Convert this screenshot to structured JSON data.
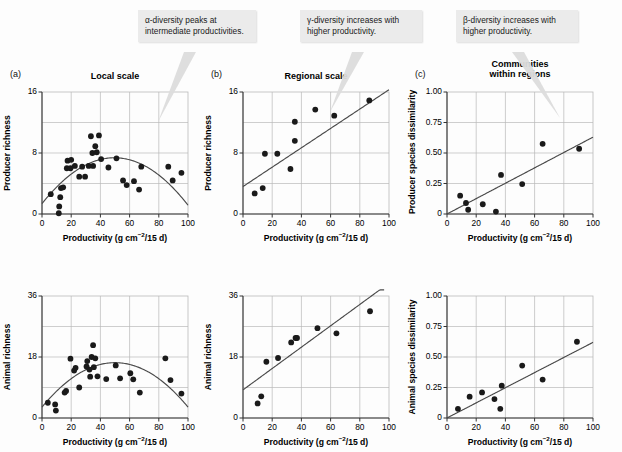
{
  "figure": {
    "width": 622,
    "height": 452,
    "background": "#fdfdfd",
    "point_color": "#1a1a1a",
    "line_color": "#4a4a4a",
    "grid_color": "#b9b9b9",
    "axis_color": "#333333",
    "callout_bg": "#ebebeb"
  },
  "callouts": [
    {
      "id": "callout-alpha",
      "text": "α-diversity peaks at\nintermediate productivities.",
      "x": 138,
      "y": 10,
      "width": 118
    },
    {
      "id": "callout-gamma",
      "text": "γ-diversity increases with\nhigher productivity.",
      "x": 300,
      "y": 10,
      "width": 122
    },
    {
      "id": "callout-beta",
      "text": "β-diversity increases with\nhigher productivity.",
      "x": 456,
      "y": 10,
      "width": 122
    }
  ],
  "axes": {
    "xlabel_prefix": "Productivity (g cm",
    "xlabel_sup": "−2",
    "xlabel_suffix": "/15 d)",
    "x_ticks": [
      0,
      20,
      40,
      60,
      80,
      100
    ],
    "x_range": [
      0,
      100
    ]
  },
  "panels": [
    {
      "letter": "(a)",
      "title": "Local scale",
      "show_title": true
    },
    {
      "letter": "(b)",
      "title": "Regional scale",
      "show_title": true
    },
    {
      "letter": "(c)",
      "title": "Communities\nwithin regions",
      "show_title": true
    }
  ],
  "chart_data": [
    {
      "id": "a-top",
      "type": "scatter",
      "title": "Local scale",
      "panel_letter": "(a)",
      "xlabel": "Productivity (g cm−2/15 d)",
      "ylabel": "Producer richness",
      "xlim": [
        0,
        100
      ],
      "ylim": [
        0,
        16
      ],
      "x_ticks": [
        0,
        20,
        40,
        60,
        80,
        100
      ],
      "y_ticks": [
        0,
        8,
        16
      ],
      "y_minor_gridlines": [
        4,
        12
      ],
      "grid": true,
      "fit": {
        "kind": "quadratic",
        "a": -0.00245,
        "b": 0.243,
        "c": 1.35
      },
      "points": [
        [
          6.0,
          2.6
        ],
        [
          11.5,
          0.1
        ],
        [
          11.8,
          1.0
        ],
        [
          12.5,
          2.2
        ],
        [
          13.0,
          3.4
        ],
        [
          14.5,
          3.5
        ],
        [
          17.0,
          6.0
        ],
        [
          17.5,
          7.0
        ],
        [
          19.5,
          6.0
        ],
        [
          20.0,
          7.1
        ],
        [
          22.5,
          6.3
        ],
        [
          25.5,
          4.9
        ],
        [
          27.5,
          6.2
        ],
        [
          29.5,
          4.9
        ],
        [
          32.0,
          6.3
        ],
        [
          33.5,
          10.2
        ],
        [
          34.5,
          8.0
        ],
        [
          35.0,
          6.3
        ],
        [
          36.5,
          8.9
        ],
        [
          37.5,
          8.1
        ],
        [
          39.0,
          10.3
        ],
        [
          40.5,
          7.2
        ],
        [
          45.5,
          6.1
        ],
        [
          51.0,
          7.3
        ],
        [
          55.5,
          4.4
        ],
        [
          58.0,
          3.8
        ],
        [
          63.0,
          4.3
        ],
        [
          66.5,
          3.2
        ],
        [
          68.0,
          6.2
        ],
        [
          86.5,
          6.2
        ],
        [
          89.5,
          4.4
        ],
        [
          95.5,
          5.4
        ]
      ]
    },
    {
      "id": "b-top",
      "type": "scatter",
      "title": "Regional scale",
      "panel_letter": "(b)",
      "xlabel": "Productivity (g cm−2/15 d)",
      "ylabel": "Producer richness",
      "xlim": [
        0,
        100
      ],
      "ylim": [
        0,
        16
      ],
      "x_ticks": [
        0,
        20,
        40,
        60,
        80,
        100
      ],
      "y_ticks": [
        0,
        8,
        16
      ],
      "y_minor_gridlines": [
        4,
        12
      ],
      "grid": true,
      "fit": {
        "kind": "linear",
        "slope": 0.127,
        "intercept": 3.6
      },
      "points": [
        [
          8.0,
          2.7
        ],
        [
          13.5,
          3.4
        ],
        [
          15.0,
          7.9
        ],
        [
          23.5,
          7.9
        ],
        [
          32.5,
          5.9
        ],
        [
          35.5,
          9.6
        ],
        [
          35.5,
          12.1
        ],
        [
          49.5,
          13.7
        ],
        [
          62.5,
          12.9
        ],
        [
          86.5,
          14.9
        ]
      ]
    },
    {
      "id": "c-top",
      "type": "scatter",
      "title": "Communities within regions",
      "panel_letter": "(c)",
      "xlabel": "Productivity (g cm−2/15 d)",
      "ylabel": "Producer species dissimilarity",
      "xlim": [
        0,
        100
      ],
      "ylim": [
        0,
        1.0
      ],
      "x_ticks": [
        0,
        20,
        40,
        60,
        80,
        100
      ],
      "y_ticks": [
        0,
        0.25,
        0.5,
        0.75,
        1.0
      ],
      "y_tick_labels": [
        "0",
        "0.25",
        "0.50",
        "0.75",
        "1.00"
      ],
      "grid": true,
      "fit": {
        "kind": "linear",
        "slope": 0.0063,
        "intercept": 0.0
      },
      "points": [
        [
          9.0,
          0.15
        ],
        [
          13.0,
          0.09
        ],
        [
          14.5,
          0.035
        ],
        [
          24.5,
          0.08
        ],
        [
          33.5,
          0.02
        ],
        [
          37.0,
          0.32
        ],
        [
          51.5,
          0.245
        ],
        [
          65.5,
          0.575
        ],
        [
          90.5,
          0.535
        ]
      ]
    },
    {
      "id": "a-bottom",
      "type": "scatter",
      "panel_letter": "(a)",
      "xlabel": "Productivity (g cm−2/15 d)",
      "ylabel": "Animal richness",
      "xlim": [
        0,
        100
      ],
      "ylim": [
        0,
        36
      ],
      "x_ticks": [
        0,
        20,
        40,
        60,
        80,
        100
      ],
      "y_ticks": [
        0,
        18,
        36
      ],
      "y_minor_gridlines": [
        9,
        27
      ],
      "grid": true,
      "fit": {
        "kind": "quadratic",
        "a": -0.00525,
        "b": 0.525,
        "c": 3.2
      },
      "points": [
        [
          4.0,
          4.5
        ],
        [
          9.0,
          4.0
        ],
        [
          9.5,
          2.2
        ],
        [
          15.5,
          7.5
        ],
        [
          16.5,
          8.0
        ],
        [
          19.5,
          17.5
        ],
        [
          22.0,
          14.0
        ],
        [
          23.0,
          14.8
        ],
        [
          25.5,
          9.0
        ],
        [
          30.5,
          15.2
        ],
        [
          31.0,
          16.8
        ],
        [
          32.5,
          14.3
        ],
        [
          33.0,
          12.2
        ],
        [
          34.0,
          18.0
        ],
        [
          35.0,
          21.5
        ],
        [
          35.5,
          15.0
        ],
        [
          36.5,
          17.6
        ],
        [
          38.0,
          12.3
        ],
        [
          44.0,
          11.5
        ],
        [
          50.5,
          15.5
        ],
        [
          53.5,
          11.7
        ],
        [
          60.5,
          13.2
        ],
        [
          62.5,
          11.4
        ],
        [
          67.0,
          7.5
        ],
        [
          84.5,
          17.6
        ],
        [
          88.0,
          11.2
        ],
        [
          95.5,
          7.2
        ]
      ]
    },
    {
      "id": "b-bottom",
      "type": "scatter",
      "panel_letter": "(b)",
      "xlabel": "Productivity (g cm−2/15 d)",
      "ylabel": "Animal richness",
      "xlim": [
        0,
        100
      ],
      "ylim": [
        0,
        36
      ],
      "x_ticks": [
        0,
        20,
        40,
        60,
        80,
        100
      ],
      "y_ticks": [
        0,
        18,
        36
      ],
      "y_minor_gridlines": [
        9,
        27
      ],
      "grid": true,
      "fit": {
        "kind": "linear",
        "slope": 0.315,
        "intercept": 8.3
      },
      "points": [
        [
          10.0,
          4.3
        ],
        [
          12.5,
          6.4
        ],
        [
          16.0,
          16.6
        ],
        [
          24.0,
          17.7
        ],
        [
          33.0,
          22.3
        ],
        [
          36.0,
          23.6
        ],
        [
          37.0,
          23.6
        ],
        [
          51.0,
          26.5
        ],
        [
          64.0,
          25.0
        ],
        [
          87.0,
          31.5
        ]
      ]
    },
    {
      "id": "c-bottom",
      "type": "scatter",
      "panel_letter": "(c)",
      "xlabel": "Productivity (g cm−2/15 d)",
      "ylabel": "Animal species dissimilarity",
      "xlim": [
        0,
        100
      ],
      "ylim": [
        0,
        1.0
      ],
      "x_ticks": [
        0,
        20,
        40,
        60,
        80,
        100
      ],
      "y_ticks": [
        0,
        0.25,
        0.5,
        0.75,
        1.0
      ],
      "y_tick_labels": [
        "0",
        "0.25",
        "0.50",
        "0.75",
        "1.00"
      ],
      "grid": true,
      "fit": {
        "kind": "linear",
        "slope": 0.0062,
        "intercept": 0.0
      },
      "points": [
        [
          7.5,
          0.075
        ],
        [
          15.5,
          0.175
        ],
        [
          24.0,
          0.21
        ],
        [
          32.5,
          0.155
        ],
        [
          36.5,
          0.075
        ],
        [
          37.5,
          0.265
        ],
        [
          51.5,
          0.43
        ],
        [
          65.5,
          0.315
        ],
        [
          89.0,
          0.625
        ]
      ]
    }
  ]
}
